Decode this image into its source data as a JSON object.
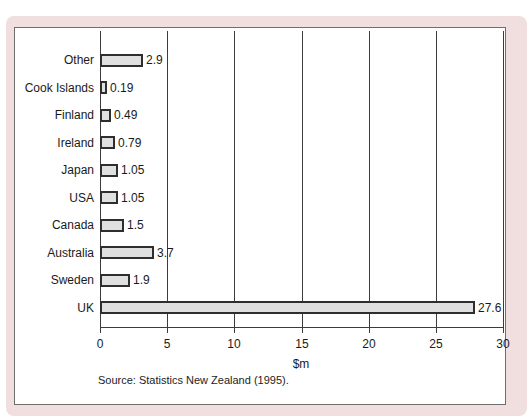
{
  "figure": {
    "frame_color": "#f1dede",
    "panel_bg": "#ffffff",
    "panel_border_color": "#6e6e6e"
  },
  "chart_data": {
    "type": "bar",
    "orientation": "horizontal",
    "title": "",
    "categories": [
      "Other",
      "Cook Islands",
      "Finland",
      "Ireland",
      "Japan",
      "USA",
      "Canada",
      "Australia",
      "Sweden",
      "UK"
    ],
    "values": [
      2.9,
      0.19,
      0.49,
      0.79,
      1.05,
      1.05,
      1.5,
      3.7,
      1.9,
      27.6
    ],
    "value_labels": [
      "2.9",
      "0.19",
      "0.49",
      "0.79",
      "1.05",
      "1.05",
      "1.5",
      "3.7",
      "1.9",
      "27.6"
    ],
    "xlabel": "$m",
    "x_ticks": [
      0,
      5,
      10,
      15,
      20,
      25,
      30
    ],
    "xlim": [
      0,
      30
    ],
    "grid": "vertical-gridlines-on",
    "legend": "none",
    "bar_fill": "#e0e0e0",
    "bar_border": "#2e2e2e",
    "axis_color": "#3c3c3c",
    "source": "Source: Statistics New Zealand (1995)."
  }
}
